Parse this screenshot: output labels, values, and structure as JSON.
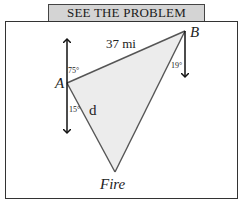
{
  "header": {
    "title": "SEE THE PROBLEM"
  },
  "diagram": {
    "points": {
      "A": {
        "label": "A"
      },
      "B": {
        "label": "B"
      },
      "Fire": {
        "label": "Fire"
      }
    },
    "edges": {
      "AB": {
        "label": "37 mi"
      },
      "AFire": {
        "label": "d"
      }
    },
    "angles": {
      "A_north": "75°",
      "A_south": "15°",
      "B_south": "19°"
    },
    "colors": {
      "triangle_fill": "#ececec",
      "stroke": "#555555",
      "arrow": "#111111",
      "header_fill": "#d4d4d4"
    }
  }
}
